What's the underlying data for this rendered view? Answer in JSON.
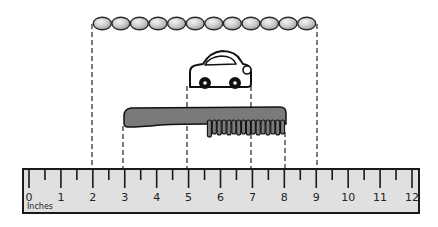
{
  "diagram": {
    "type": "measurement-with-ruler",
    "ruler": {
      "unit_label": "Inches",
      "labels": [
        "0",
        "1",
        "2",
        "3",
        "4",
        "5",
        "6",
        "7",
        "8",
        "9",
        "10",
        "11",
        "12"
      ],
      "min": 0,
      "max": 12,
      "fill_color": "#e0e0e0",
      "border_color": "#1a1a1a"
    },
    "objects": [
      {
        "name": "bead-necklace",
        "start_inch": 2,
        "end_inch": 9,
        "bead_count": 12,
        "bead_color": "#cfcfcf"
      },
      {
        "name": "toy-car",
        "start_inch": 5,
        "end_inch": 7
      },
      {
        "name": "comb",
        "start_inch": 3,
        "end_inch": 8,
        "color": "#7a7a7a"
      }
    ]
  }
}
